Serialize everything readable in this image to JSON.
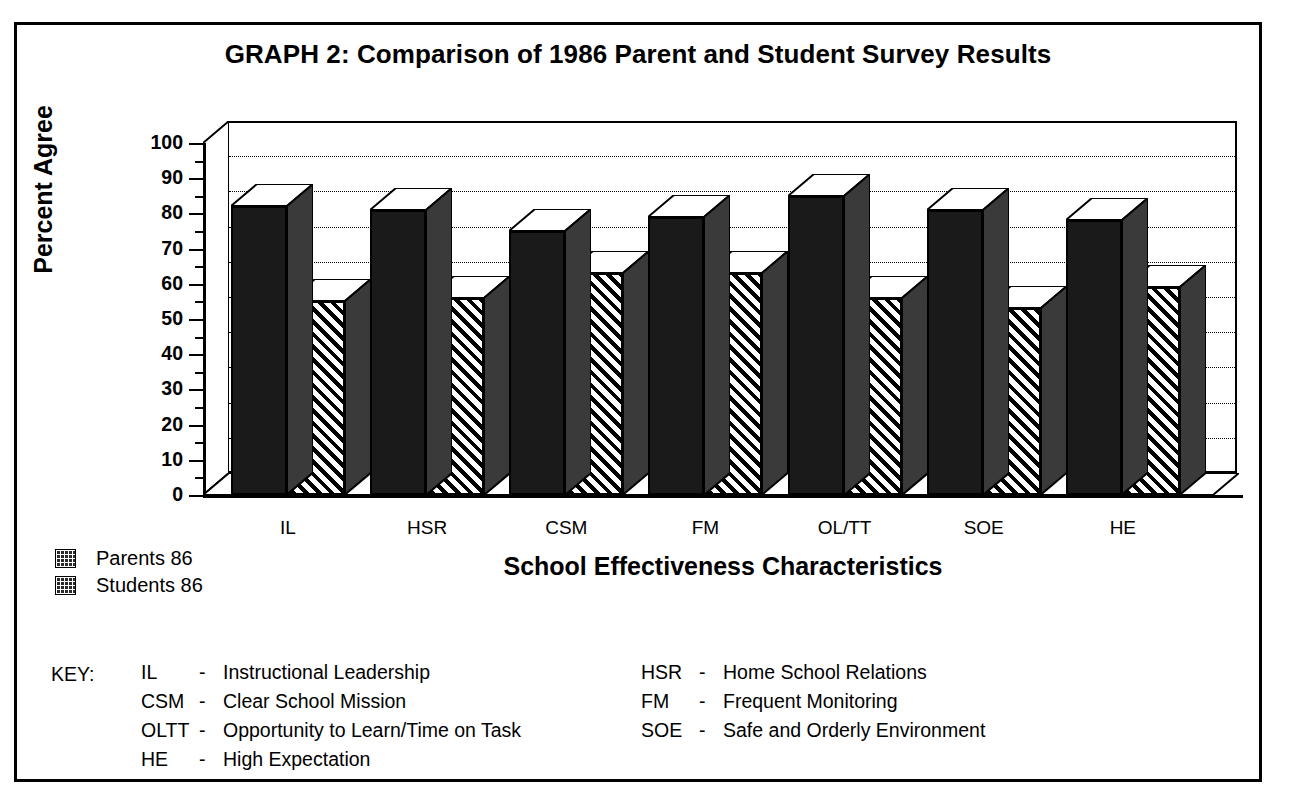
{
  "chart_data": {
    "type": "bar",
    "title": "GRAPH 2:  Comparison of 1986 Parent and Student Survey Results",
    "xlabel": "School Effectiveness Characteristics",
    "ylabel": "Percent Agree",
    "ylim": [
      0,
      100
    ],
    "yticks": [
      0,
      10,
      20,
      30,
      40,
      50,
      60,
      70,
      80,
      90,
      100
    ],
    "grid": true,
    "legend_position": "below-left",
    "categories": [
      "IL",
      "HSR",
      "CSM",
      "FM",
      "OL/TT",
      "SOE",
      "HE"
    ],
    "series": [
      {
        "name": "Parents 86",
        "fill": "solid",
        "values": [
          82,
          81,
          75,
          79,
          85,
          81,
          78
        ]
      },
      {
        "name": "Students 86",
        "fill": "hatch",
        "values": [
          55,
          56,
          63,
          63,
          56,
          53,
          59
        ]
      }
    ]
  },
  "legend": {
    "items": [
      {
        "label": "Parents 86",
        "swatch": "solid-black"
      },
      {
        "label": "Students 86",
        "swatch": "hatched"
      }
    ]
  },
  "key": {
    "heading": "KEY:",
    "left_column": [
      {
        "abbr": "IL",
        "dash": "-",
        "desc": "Instructional Leadership"
      },
      {
        "abbr": "CSM",
        "dash": "-",
        "desc": "Clear School Mission"
      },
      {
        "abbr": "OLTT",
        "dash": "-",
        "desc": "Opportunity to Learn/Time on Task"
      },
      {
        "abbr": "HE",
        "dash": "-",
        "desc": "High Expectation"
      }
    ],
    "right_column": [
      {
        "abbr": "HSR",
        "dash": "-",
        "desc": "Home School Relations"
      },
      {
        "abbr": "FM",
        "dash": "-",
        "desc": "Frequent Monitoring"
      },
      {
        "abbr": "SOE",
        "dash": "-",
        "desc": "Safe and Orderly Environment"
      }
    ]
  },
  "colors": {
    "ink": "#000000",
    "paper": "#ffffff",
    "parents_fill": "#1a1a1a",
    "students_fill": "#ffffff"
  }
}
